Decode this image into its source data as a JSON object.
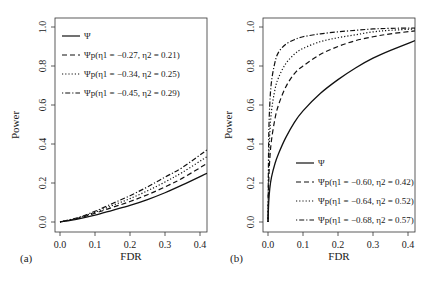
{
  "chart_data": [
    {
      "panel": "(a)",
      "type": "line",
      "xlabel": "FDR",
      "ylabel": "Power",
      "xlim": [
        0.0,
        0.42
      ],
      "ylim": [
        0.0,
        1.0
      ],
      "xticks": [
        "0.0",
        "0.1",
        "0.2",
        "0.3",
        "0.4"
      ],
      "yticks": [
        "0.0",
        "0.2",
        "0.4",
        "0.6",
        "0.8",
        "1.0"
      ],
      "grid": false,
      "legend_position": "top-left",
      "x": [
        0.0,
        0.05,
        0.1,
        0.15,
        0.2,
        0.25,
        0.3,
        0.35,
        0.42
      ],
      "series": [
        {
          "name": "Ψ",
          "style": "solid",
          "values": [
            0.0,
            0.015,
            0.035,
            0.06,
            0.085,
            0.115,
            0.15,
            0.19,
            0.25
          ]
        },
        {
          "name": "Ψp(η1=−0.27, η2=0.21)",
          "style": "dashed",
          "values": [
            0.0,
            0.018,
            0.045,
            0.075,
            0.105,
            0.14,
            0.18,
            0.225,
            0.3
          ]
        },
        {
          "name": "Ψp(η1=−0.34, η2=0.25)",
          "style": "dotted",
          "values": [
            0.0,
            0.02,
            0.05,
            0.085,
            0.12,
            0.16,
            0.205,
            0.255,
            0.335
          ]
        },
        {
          "name": "Ψp(η1=−0.45, η2=0.29)",
          "style": "dotdash",
          "values": [
            0.0,
            0.022,
            0.055,
            0.095,
            0.135,
            0.18,
            0.23,
            0.28,
            0.37
          ]
        }
      ]
    },
    {
      "panel": "(b)",
      "type": "line",
      "xlabel": "FDR",
      "ylabel": "Power",
      "xlim": [
        0.0,
        0.42
      ],
      "ylim": [
        0.0,
        1.0
      ],
      "xticks": [
        "0.0",
        "0.1",
        "0.2",
        "0.3",
        "0.4"
      ],
      "yticks": [
        "0.0",
        "0.2",
        "0.4",
        "0.6",
        "0.8",
        "1.0"
      ],
      "grid": false,
      "legend_position": "bottom-right",
      "x": [
        0.0,
        0.002,
        0.005,
        0.01,
        0.02,
        0.03,
        0.05,
        0.075,
        0.1,
        0.15,
        0.2,
        0.25,
        0.3,
        0.35,
        0.42
      ],
      "series": [
        {
          "name": "Ψ",
          "style": "solid",
          "values": [
            0.0,
            0.1,
            0.17,
            0.23,
            0.3,
            0.35,
            0.43,
            0.51,
            0.57,
            0.66,
            0.73,
            0.79,
            0.84,
            0.88,
            0.93
          ]
        },
        {
          "name": "Ψp(η1=−0.60, η2=0.42)",
          "style": "dashed",
          "values": [
            0.0,
            0.2,
            0.32,
            0.42,
            0.53,
            0.6,
            0.69,
            0.76,
            0.8,
            0.86,
            0.9,
            0.93,
            0.95,
            0.965,
            0.98
          ]
        },
        {
          "name": "Ψp(η1=−0.64, η2=0.52)",
          "style": "dotted",
          "values": [
            0.0,
            0.3,
            0.45,
            0.57,
            0.68,
            0.74,
            0.81,
            0.86,
            0.89,
            0.925,
            0.945,
            0.96,
            0.975,
            0.983,
            0.99
          ]
        },
        {
          "name": "Ψp(η1=−0.68, η2=0.57)",
          "style": "dotdash",
          "values": [
            0.0,
            0.42,
            0.6,
            0.72,
            0.82,
            0.87,
            0.91,
            0.935,
            0.95,
            0.965,
            0.975,
            0.983,
            0.99,
            0.993,
            0.995
          ]
        }
      ]
    }
  ],
  "panels": {
    "a": {
      "label": "(a)",
      "xlabel": "FDR",
      "ylabel": "Power",
      "xticks": [
        "0.0",
        "0.1",
        "0.2",
        "0.3",
        "0.4"
      ],
      "yticks": [
        "0.0",
        "0.2",
        "0.4",
        "0.6",
        "0.8",
        "1.0"
      ],
      "legend": [
        {
          "label": "Ψ",
          "sub": ""
        },
        {
          "label": "Ψp(η1 = −0.27, η2 = 0.21)"
        },
        {
          "label": "Ψp(η1 = −0.34, η2 = 0.25)"
        },
        {
          "label": "Ψp(η1 = −0.45, η2 = 0.29)"
        }
      ]
    },
    "b": {
      "label": "(b)",
      "xlabel": "FDR",
      "ylabel": "Power",
      "xticks": [
        "0.0",
        "0.1",
        "0.2",
        "0.3",
        "0.4"
      ],
      "yticks": [
        "0.0",
        "0.2",
        "0.4",
        "0.6",
        "0.8",
        "1.0"
      ],
      "legend": [
        {
          "label": "Ψ"
        },
        {
          "label": "Ψp(η1 = −0.60, η2 = 0.42)"
        },
        {
          "label": "Ψp(η1 = −0.64, η2 = 0.52)"
        },
        {
          "label": "Ψp(η1 = −0.68, η2 = 0.57)"
        }
      ]
    }
  },
  "colors": {
    "line": "#111111",
    "axis": "#333333",
    "text": "#222222"
  }
}
